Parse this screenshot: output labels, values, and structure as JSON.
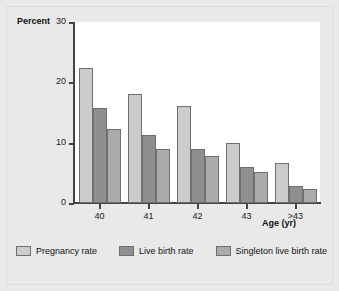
{
  "chart_data": {
    "type": "bar",
    "title": "",
    "subtitle": "",
    "xlabel": "Age (yr)",
    "ylabel": "Percent",
    "categories": [
      "40",
      "41",
      "42",
      "43",
      ">43"
    ],
    "series": [
      {
        "name": "Pregnancy rate",
        "color": "#cbcbcb",
        "values": [
          22.4,
          18.0,
          16.0,
          10.0,
          6.7
        ]
      },
      {
        "name": "Live birth rate",
        "color": "#8f8f8f",
        "values": [
          15.8,
          11.3,
          9.0,
          5.9,
          2.9
        ]
      },
      {
        "name": "Singleton live birth rate",
        "color": "#ababab",
        "values": [
          12.3,
          9.0,
          7.8,
          5.1,
          2.4
        ]
      }
    ],
    "ylim": [
      0,
      30
    ],
    "yticks": [
      0,
      10,
      20,
      30
    ],
    "ytick_labels": [
      "0",
      "10",
      "20",
      "30"
    ],
    "grid": false,
    "legend_position": "bottom",
    "plot_background": "#ffffff",
    "figure_background": "#e9e9e9",
    "axis_color": "#444444",
    "bar_edge_color": "#6f6f6f"
  }
}
